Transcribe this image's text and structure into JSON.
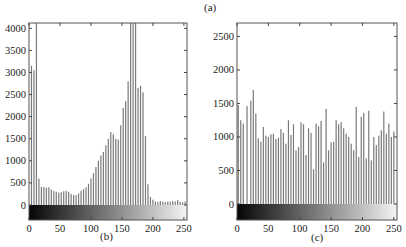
{
  "figure": {
    "caption_a": "(a)",
    "caption_b": "(b)",
    "caption_c": "(c)"
  },
  "chart_data": [
    {
      "id": "b",
      "type": "bar",
      "title": "",
      "caption": "(b)",
      "xlabel": "",
      "ylabel": "",
      "xlim": [
        0,
        255
      ],
      "ylim": [
        -350,
        4120
      ],
      "grid": false,
      "legend": null,
      "x_ticks": [
        0,
        50,
        100,
        150,
        200,
        250
      ],
      "x_tick_labels": [
        "0",
        "50",
        "100",
        "150",
        "200",
        "250"
      ],
      "y_ticks": [
        0,
        500,
        1000,
        1500,
        2000,
        2500,
        3000,
        3500,
        4000
      ],
      "y_tick_labels": [
        "0",
        "500",
        "1000",
        "1500",
        "2000",
        "2500",
        "3000",
        "3500",
        "4000"
      ],
      "colorbar": "grayscale gradient black-to-white below x-axis",
      "x": [
        4,
        8,
        12,
        16,
        20,
        24,
        28,
        32,
        36,
        40,
        44,
        48,
        52,
        56,
        60,
        64,
        68,
        72,
        76,
        80,
        84,
        88,
        92,
        96,
        100,
        104,
        108,
        112,
        116,
        120,
        124,
        128,
        132,
        136,
        140,
        144,
        148,
        152,
        156,
        160,
        164,
        168,
        172,
        176,
        180,
        184,
        188,
        192,
        196,
        200,
        204,
        208,
        212,
        216,
        220,
        224,
        228,
        232,
        236,
        240,
        244,
        248,
        252
      ],
      "values": [
        3150,
        3050,
        4120,
        600,
        410,
        410,
        390,
        400,
        350,
        320,
        300,
        280,
        290,
        310,
        320,
        300,
        250,
        230,
        220,
        260,
        320,
        360,
        400,
        480,
        600,
        720,
        860,
        1000,
        1120,
        1200,
        1350,
        1500,
        1650,
        1600,
        1500,
        1480,
        1800,
        2200,
        2350,
        2800,
        4120,
        4120,
        4120,
        2650,
        2700,
        2550,
        1560,
        470,
        180,
        120,
        80,
        70,
        90,
        75,
        70,
        80,
        75,
        90,
        80,
        110,
        70,
        60,
        80
      ]
    },
    {
      "id": "c",
      "type": "bar",
      "title": "",
      "caption": "(c)",
      "xlabel": "",
      "ylabel": "",
      "xlim": [
        0,
        255
      ],
      "ylim": [
        -230,
        2700
      ],
      "grid": false,
      "legend": null,
      "x_ticks": [
        0,
        50,
        100,
        150,
        200,
        250
      ],
      "x_tick_labels": [
        "0",
        "50",
        "100",
        "150",
        "200",
        "250"
      ],
      "y_ticks": [
        0,
        500,
        1000,
        1500,
        2000,
        2500
      ],
      "y_tick_labels": [
        "0",
        "500",
        "1000",
        "1500",
        "2000",
        "2500"
      ],
      "colorbar": "grayscale gradient black-to-white below x-axis",
      "x": [
        2,
        6,
        10,
        16,
        22,
        26,
        30,
        34,
        38,
        42,
        46,
        50,
        54,
        58,
        62,
        66,
        70,
        74,
        78,
        82,
        86,
        90,
        94,
        98,
        102,
        106,
        110,
        114,
        118,
        122,
        126,
        130,
        134,
        138,
        142,
        146,
        150,
        154,
        158,
        162,
        166,
        170,
        174,
        178,
        182,
        186,
        190,
        194,
        198,
        202,
        206,
        210,
        214,
        218,
        222,
        226,
        230,
        234,
        238,
        242,
        246,
        250
      ],
      "values": [
        1480,
        1250,
        1200,
        1460,
        1540,
        1700,
        1350,
        980,
        930,
        1150,
        1020,
        1000,
        1040,
        1050,
        970,
        990,
        1120,
        1060,
        900,
        1250,
        1030,
        1190,
        800,
        850,
        1220,
        1190,
        730,
        1130,
        1060,
        520,
        1200,
        1160,
        1240,
        620,
        1420,
        800,
        920,
        930,
        1250,
        1190,
        1220,
        1130,
        1050,
        1000,
        900,
        800,
        1450,
        700,
        1300,
        1360,
        680,
        1390,
        650,
        1000,
        880,
        1020,
        1100,
        1380,
        1050,
        1200,
        1000,
        1080
      ]
    }
  ]
}
